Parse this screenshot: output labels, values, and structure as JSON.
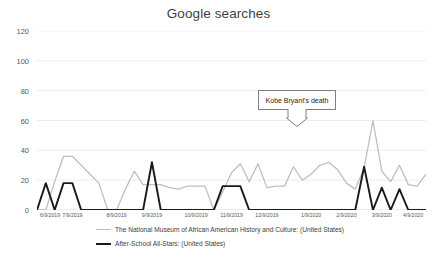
{
  "chart_data": {
    "type": "line",
    "title": "Google searches",
    "xlabel": "",
    "ylabel": "",
    "ylim": [
      0,
      120
    ],
    "yticks": [
      0,
      20,
      40,
      60,
      80,
      100,
      120
    ],
    "grid": true,
    "legend_position": "bottom",
    "xtick_labels": [
      "6/9/2019",
      "7/9/2019",
      "8/9/2019",
      "9/9/2019",
      "10/9/2019",
      "11/9/2019",
      "12/9/2019",
      "1/9/2020",
      "2/9/2020",
      "3/9/2020",
      "4/9/2020"
    ],
    "xtick_indices": [
      0,
      4,
      9,
      13,
      18,
      22,
      26,
      31,
      35,
      39,
      44
    ],
    "n_points": 45,
    "series": [
      {
        "name": "The National Museum of African American History and Culture: (United States)",
        "color": "#bfbfbf",
        "values": [
          0,
          0,
          19,
          36,
          36,
          30,
          24,
          18,
          0,
          0,
          14,
          26,
          17,
          17,
          17,
          15,
          14,
          16,
          16,
          16,
          0,
          12,
          25,
          31,
          19,
          31,
          15,
          16,
          16,
          29,
          20,
          24,
          30,
          32,
          27,
          18,
          14,
          28,
          60,
          26,
          19,
          30,
          17,
          16,
          24
        ]
      },
      {
        "name": "After-School All-Stars: (United States)",
        "color": "#1a1a1a",
        "values": [
          0,
          18,
          0,
          18,
          18,
          0,
          0,
          0,
          0,
          0,
          0,
          0,
          0,
          32,
          0,
          0,
          0,
          0,
          0,
          0,
          0,
          16,
          16,
          16,
          0,
          0,
          0,
          0,
          0,
          0,
          0,
          0,
          0,
          0,
          0,
          0,
          0,
          29,
          0,
          15,
          0,
          14,
          0,
          0,
          0
        ]
      }
    ],
    "annotations": [
      {
        "label": "Kobe Bryant's death",
        "target_index": 38,
        "target_value": 60
      }
    ]
  },
  "colors": {
    "series_gray": "#bfbfbf",
    "series_black": "#1a1a1a",
    "gridline": "#e8e8e8",
    "axis_line": "#d9d9d9",
    "text": "#595959",
    "title_text": "#3f3f3f",
    "callout_border": "#7f7f7f",
    "background": "#ffffff"
  }
}
